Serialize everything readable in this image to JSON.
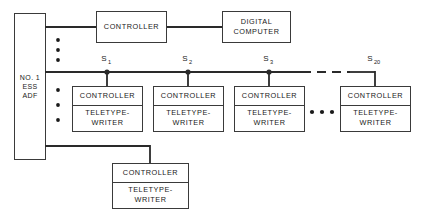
{
  "diagram": {
    "colors": {
      "line": "#2a2a2a",
      "box_stroke": "#3a3a3a",
      "background": "#ffffff",
      "text": "#1a1a1a"
    },
    "left_unit": {
      "name": "ess-adf-unit",
      "lines": [
        "NO. 1",
        "ESS",
        "ADF"
      ]
    },
    "top_row": {
      "controller_label": "CONTROLLER",
      "computer_lines": [
        "DIGITAL",
        "COMPUTER"
      ]
    },
    "labels": {
      "controller": "CONTROLLER",
      "teletype_line1": "TELETYPE-",
      "teletype_line2": "WRITER"
    },
    "stations": [
      {
        "id": "s1",
        "base": "S",
        "sub": "1",
        "x": 107
      },
      {
        "id": "s2",
        "base": "S",
        "sub": "2",
        "x": 188
      },
      {
        "id": "s3",
        "base": "S",
        "sub": "3",
        "x": 269
      },
      {
        "id": "s20",
        "base": "S",
        "sub": "20",
        "x": 375
      }
    ],
    "bottom_station": {
      "name": "bottom-station",
      "controller_label": "CONTROLLER",
      "teletype_line1": "TELETYPE-",
      "teletype_line2": "WRITER"
    },
    "vertical_ellipsis_groups": 2,
    "horizontal_ellipsis_count": 3,
    "bus_dash_segment": {
      "from_x": 300,
      "to_x": 348,
      "y": 72
    }
  }
}
